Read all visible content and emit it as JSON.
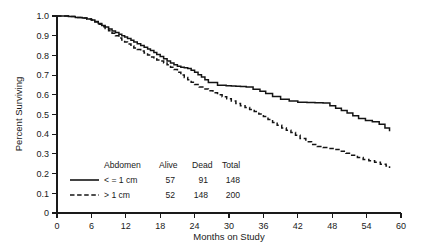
{
  "chart_data": {
    "type": "line",
    "title": "",
    "xlabel": "Months on Study",
    "ylabel": "Percent Surviving",
    "xlim": [
      0,
      60
    ],
    "ylim": [
      0,
      1.0
    ],
    "xticks": [
      0,
      6,
      12,
      18,
      24,
      30,
      36,
      42,
      48,
      54,
      60
    ],
    "xticklabels": [
      "0",
      "6",
      "12",
      "18",
      "24",
      "30",
      "36",
      "42",
      "48",
      "54",
      "60"
    ],
    "yticks": [
      0,
      0.1,
      0.2,
      0.3,
      0.4,
      0.5,
      0.6,
      0.7,
      0.8,
      0.9,
      1.0
    ],
    "yticklabels": [
      "0",
      "0.1",
      "0.2",
      "0.3",
      "0.4",
      "0.5",
      "0.6",
      "0.7",
      "0.8",
      "0.9",
      "1.0"
    ],
    "grid": false,
    "legend_position": "lower-left-inside",
    "drawstyle": "steps-post",
    "series": [
      {
        "name": "< = 1 cm",
        "style": "solid",
        "x": [
          0,
          2.0,
          3.2,
          4.4,
          5.2,
          6.0,
          6.6,
          7.2,
          7.8,
          8.4,
          9.0,
          9.6,
          10.2,
          10.8,
          11.3,
          11.8,
          12.3,
          12.9,
          13.4,
          14.0,
          14.6,
          15.2,
          15.8,
          16.3,
          16.9,
          17.4,
          18.0,
          18.6,
          19.2,
          19.8,
          20.4,
          21.0,
          21.6,
          22.2,
          22.8,
          23.4,
          24.0,
          24.6,
          25.2,
          25.8,
          26.4,
          28.0,
          29.5,
          30.4,
          31.2,
          32.0,
          33.0,
          34.2,
          35.4,
          36.4,
          37.6,
          39.0,
          40.5,
          42.0,
          43.6,
          45.0,
          46.4,
          47.6,
          48.6,
          49.6,
          50.6,
          51.6,
          52.6,
          53.8,
          55.0,
          56.2,
          57.2,
          58.0
        ],
        "y": [
          1.0,
          0.997,
          0.993,
          0.99,
          0.985,
          0.98,
          0.972,
          0.962,
          0.952,
          0.944,
          0.934,
          0.924,
          0.916,
          0.907,
          0.9,
          0.893,
          0.886,
          0.877,
          0.868,
          0.859,
          0.85,
          0.842,
          0.833,
          0.825,
          0.815,
          0.805,
          0.795,
          0.783,
          0.772,
          0.762,
          0.753,
          0.745,
          0.74,
          0.737,
          0.733,
          0.725,
          0.715,
          0.702,
          0.69,
          0.676,
          0.663,
          0.648,
          0.646,
          0.645,
          0.643,
          0.642,
          0.64,
          0.628,
          0.618,
          0.606,
          0.592,
          0.578,
          0.568,
          0.562,
          0.561,
          0.56,
          0.558,
          0.545,
          0.532,
          0.52,
          0.507,
          0.494,
          0.48,
          0.47,
          0.463,
          0.45,
          0.432,
          0.415
        ]
      },
      {
        "name": "> 1 cm",
        "style": "dashed",
        "x": [
          0,
          2.0,
          3.2,
          4.4,
          5.2,
          6.0,
          6.6,
          7.2,
          7.8,
          8.4,
          9.0,
          9.6,
          10.2,
          10.8,
          11.3,
          11.8,
          12.3,
          12.9,
          13.4,
          14.0,
          14.6,
          15.2,
          15.8,
          16.3,
          16.9,
          17.4,
          18.0,
          18.6,
          19.2,
          19.8,
          20.4,
          21.0,
          21.6,
          22.2,
          22.8,
          23.4,
          24.0,
          24.8,
          25.6,
          26.4,
          27.2,
          28.0,
          28.8,
          29.6,
          30.4,
          31.2,
          32.0,
          32.8,
          33.6,
          34.4,
          35.2,
          36.0,
          36.8,
          37.6,
          38.4,
          39.2,
          40.0,
          40.8,
          41.6,
          42.4,
          43.4,
          44.4,
          45.4,
          46.4,
          47.4,
          48.4,
          49.4,
          50.4,
          51.4,
          52.4,
          53.4,
          54.4,
          55.4,
          56.4,
          57.4,
          58.0
        ],
        "y": [
          1.0,
          0.997,
          0.993,
          0.99,
          0.985,
          0.98,
          0.97,
          0.958,
          0.946,
          0.936,
          0.925,
          0.913,
          0.9,
          0.888,
          0.878,
          0.868,
          0.858,
          0.848,
          0.838,
          0.83,
          0.822,
          0.812,
          0.802,
          0.792,
          0.783,
          0.777,
          0.772,
          0.762,
          0.752,
          0.74,
          0.728,
          0.714,
          0.7,
          0.688,
          0.676,
          0.664,
          0.652,
          0.64,
          0.63,
          0.62,
          0.61,
          0.6,
          0.59,
          0.58,
          0.568,
          0.556,
          0.545,
          0.535,
          0.525,
          0.515,
          0.503,
          0.49,
          0.475,
          0.46,
          0.445,
          0.432,
          0.42,
          0.408,
          0.395,
          0.378,
          0.362,
          0.348,
          0.338,
          0.332,
          0.328,
          0.322,
          0.313,
          0.303,
          0.293,
          0.282,
          0.272,
          0.265,
          0.258,
          0.248,
          0.238,
          0.228
        ]
      }
    ]
  },
  "legend": {
    "headers": [
      "Abdomen",
      "Alive",
      "Dead",
      "Total"
    ],
    "rows": [
      {
        "label": "< = 1 cm",
        "alive": "57",
        "dead": "91",
        "total": "148",
        "style": "solid"
      },
      {
        "label": "> 1 cm",
        "alive": "52",
        "dead": "148",
        "total": "200",
        "style": "dashed"
      }
    ]
  },
  "colors": {
    "line": "#141414",
    "axis": "#1a1a1a",
    "background": "#ffffff"
  }
}
